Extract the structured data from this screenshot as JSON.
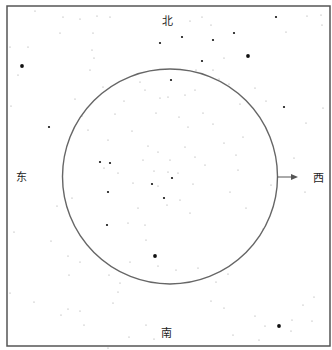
{
  "diagram": {
    "title": "",
    "type": "star-chart",
    "directions": {
      "north": "北",
      "south": "南",
      "east": "东",
      "west": "西"
    },
    "frame": {
      "x": 7,
      "y": 6,
      "width": 323,
      "height": 340,
      "stroke": "#555555"
    },
    "horizon_circle": {
      "cx": 170,
      "cy": 176.5,
      "r": 107.5,
      "stroke": "#666666"
    },
    "arrow": {
      "from": [
        277,
        177
      ],
      "to": [
        298,
        177
      ],
      "points_to": "west",
      "color": "#555555"
    },
    "bright_stars": [
      [
        22,
        66
      ],
      [
        49,
        127
      ],
      [
        276,
        17
      ],
      [
        160,
        43
      ],
      [
        171,
        80
      ],
      [
        248,
        56
      ],
      [
        284,
        107
      ],
      [
        100,
        162
      ],
      [
        110,
        163
      ],
      [
        107,
        225
      ],
      [
        108,
        192
      ],
      [
        155,
        256
      ],
      [
        279,
        326
      ],
      [
        164,
        198
      ],
      [
        152,
        184
      ],
      [
        172,
        178
      ],
      [
        182,
        37
      ],
      [
        213,
        40
      ],
      [
        202,
        61
      ],
      [
        234,
        33
      ]
    ],
    "big_stars": [
      [
        155,
        256
      ],
      [
        22,
        66
      ],
      [
        279,
        326
      ],
      [
        248,
        56
      ]
    ],
    "faint_stars": [
      [
        35,
        11
      ],
      [
        63,
        17
      ],
      [
        80,
        19
      ],
      [
        110,
        17
      ],
      [
        97,
        16
      ],
      [
        60,
        33
      ],
      [
        28,
        47
      ],
      [
        92,
        50
      ],
      [
        93,
        33
      ],
      [
        10,
        47
      ],
      [
        18,
        75
      ],
      [
        94,
        58
      ],
      [
        75,
        99
      ],
      [
        90,
        70
      ],
      [
        11,
        106
      ],
      [
        82,
        116
      ],
      [
        103,
        87
      ],
      [
        115,
        114
      ],
      [
        132,
        131
      ],
      [
        108,
        140
      ],
      [
        88,
        130
      ],
      [
        124,
        101
      ],
      [
        140,
        82
      ],
      [
        145,
        90
      ],
      [
        160,
        98
      ],
      [
        156,
        113
      ],
      [
        168,
        97
      ],
      [
        185,
        95
      ],
      [
        195,
        90
      ],
      [
        179,
        117
      ],
      [
        188,
        127
      ],
      [
        203,
        113
      ],
      [
        213,
        124
      ],
      [
        229,
        84
      ],
      [
        240,
        104
      ],
      [
        255,
        88
      ],
      [
        266,
        101
      ],
      [
        243,
        137
      ],
      [
        236,
        155
      ],
      [
        224,
        143
      ],
      [
        238,
        170
      ],
      [
        230,
        192
      ],
      [
        246,
        208
      ],
      [
        263,
        229
      ],
      [
        271,
        185
      ],
      [
        294,
        158
      ],
      [
        305,
        192
      ],
      [
        323,
        108
      ],
      [
        306,
        123
      ],
      [
        307,
        16
      ],
      [
        321,
        15
      ],
      [
        322,
        25
      ],
      [
        286,
        32
      ],
      [
        202,
        17
      ],
      [
        190,
        21
      ],
      [
        211,
        25
      ],
      [
        213,
        70
      ],
      [
        224,
        58
      ],
      [
        219,
        79
      ],
      [
        196,
        70
      ],
      [
        148,
        146
      ],
      [
        158,
        152
      ],
      [
        170,
        160
      ],
      [
        168,
        172
      ],
      [
        178,
        173
      ],
      [
        185,
        147
      ],
      [
        154,
        171
      ],
      [
        143,
        160
      ],
      [
        158,
        186
      ],
      [
        167,
        205
      ],
      [
        180,
        200
      ],
      [
        193,
        184
      ],
      [
        190,
        213
      ],
      [
        205,
        165
      ],
      [
        195,
        157
      ],
      [
        133,
        183
      ],
      [
        118,
        173
      ],
      [
        72,
        198
      ],
      [
        57,
        206
      ],
      [
        51,
        241
      ],
      [
        68,
        256
      ],
      [
        80,
        262
      ],
      [
        69,
        275
      ],
      [
        34,
        302
      ],
      [
        68,
        309
      ],
      [
        80,
        311
      ],
      [
        84,
        325
      ],
      [
        109,
        275
      ],
      [
        120,
        283
      ],
      [
        118,
        292
      ],
      [
        113,
        303
      ],
      [
        128,
        223
      ],
      [
        138,
        208
      ],
      [
        146,
        240
      ],
      [
        198,
        268
      ],
      [
        216,
        282
      ],
      [
        228,
        274
      ],
      [
        211,
        301
      ],
      [
        224,
        308
      ],
      [
        233,
        335
      ],
      [
        255,
        316
      ],
      [
        259,
        340
      ],
      [
        265,
        326
      ],
      [
        292,
        320
      ],
      [
        303,
        305
      ],
      [
        314,
        297
      ],
      [
        312,
        321
      ],
      [
        291,
        331
      ],
      [
        146,
        325
      ],
      [
        154,
        339
      ],
      [
        108,
        348
      ],
      [
        129,
        337
      ],
      [
        104,
        168
      ],
      [
        61,
        315
      ],
      [
        14,
        232
      ],
      [
        10,
        293
      ],
      [
        158,
        266
      ],
      [
        176,
        270
      ],
      [
        145,
        225
      ],
      [
        130,
        262
      ]
    ],
    "colors": {
      "background": "#ffffff",
      "star": "#111111",
      "faint_star": "#9a9a9a",
      "text": "#222222"
    }
  }
}
